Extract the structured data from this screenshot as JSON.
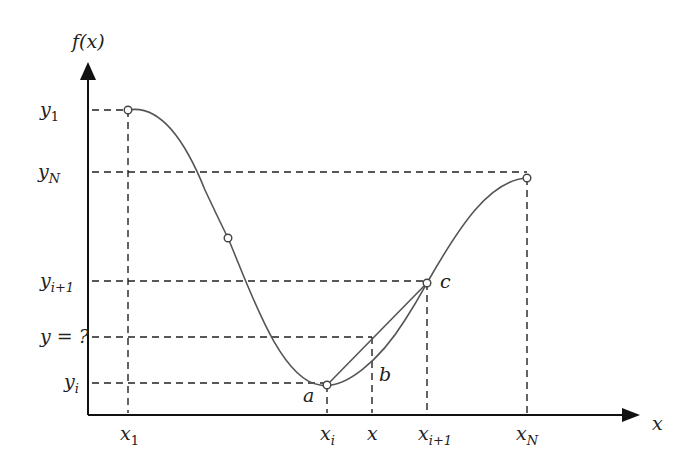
{
  "diagram": {
    "axes": {
      "y_label": "f(x)",
      "x_label": "x"
    },
    "y_ticks": [
      {
        "base": "y",
        "sub": "1",
        "label": "y1"
      },
      {
        "base": "y",
        "sub": "N",
        "label": "yN"
      },
      {
        "base": "y",
        "sub": "i+1",
        "label": "yi+1"
      },
      {
        "base": "y = ?",
        "sub": "",
        "label": "y = ?"
      },
      {
        "base": "y",
        "sub": "i",
        "label": "yi"
      }
    ],
    "x_ticks": [
      {
        "base": "x",
        "sub": "1",
        "label": "x1"
      },
      {
        "base": "x",
        "sub": "i",
        "label": "xi"
      },
      {
        "base": "x",
        "sub": "",
        "label": "x"
      },
      {
        "base": "x",
        "sub": "i+1",
        "label": "xi+1"
      },
      {
        "base": "x",
        "sub": "N",
        "label": "xN"
      }
    ],
    "point_labels": {
      "a": "a",
      "b": "b",
      "c": "c"
    },
    "colors": {
      "curve": "#555555",
      "axis": "#111111",
      "dashed": "#222222",
      "text": "#222222"
    }
  }
}
